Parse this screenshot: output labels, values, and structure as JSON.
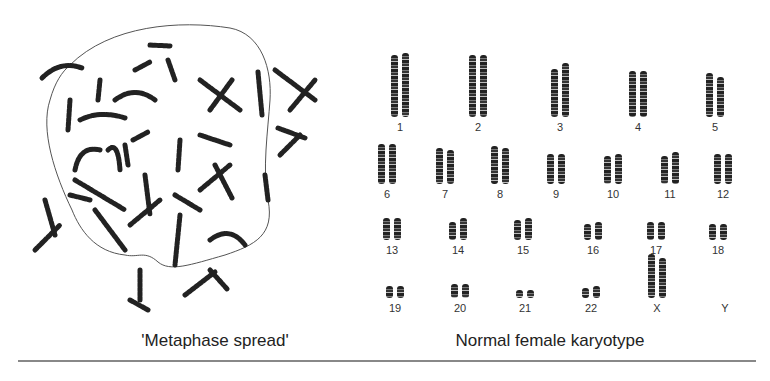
{
  "metaphase": {
    "caption": "'Metaphase spread'"
  },
  "karyotype": {
    "caption": "Normal female karyotype",
    "rows": [
      {
        "labels": [
          "1",
          "2",
          "3",
          "4",
          "5"
        ],
        "x": [
          400,
          478,
          560,
          638,
          715
        ],
        "label_y": 121,
        "heights": [
          [
            62,
            64
          ],
          [
            62,
            62
          ],
          [
            48,
            54
          ],
          [
            46,
            46
          ],
          [
            44,
            40
          ]
        ]
      },
      {
        "labels": [
          "6",
          "7",
          "8",
          "9",
          "10",
          "11",
          "12"
        ],
        "x": [
          387,
          445,
          500,
          556,
          613,
          670,
          723
        ],
        "label_y": 188,
        "heights": [
          [
            40,
            40
          ],
          [
            36,
            34
          ],
          [
            38,
            36
          ],
          [
            30,
            30
          ],
          [
            28,
            30
          ],
          [
            28,
            32
          ],
          [
            30,
            30
          ]
        ]
      },
      {
        "labels": [
          "13",
          "14",
          "15",
          "16",
          "17",
          "18"
        ],
        "x": [
          392,
          458,
          523,
          593,
          656,
          718
        ],
        "label_y": 244,
        "heights": [
          [
            22,
            22
          ],
          [
            18,
            22
          ],
          [
            20,
            22
          ],
          [
            16,
            18
          ],
          [
            18,
            18
          ],
          [
            16,
            16
          ]
        ]
      },
      {
        "labels": [
          "19",
          "20",
          "21",
          "22",
          "X",
          "Y"
        ],
        "x": [
          395,
          460,
          525,
          591,
          657,
          725
        ],
        "label_y": 302,
        "heights": [
          [
            12,
            12
          ],
          [
            14,
            14
          ],
          [
            8,
            8
          ],
          [
            10,
            12
          ],
          [
            44,
            40
          ],
          [
            0,
            0
          ]
        ]
      }
    ]
  }
}
